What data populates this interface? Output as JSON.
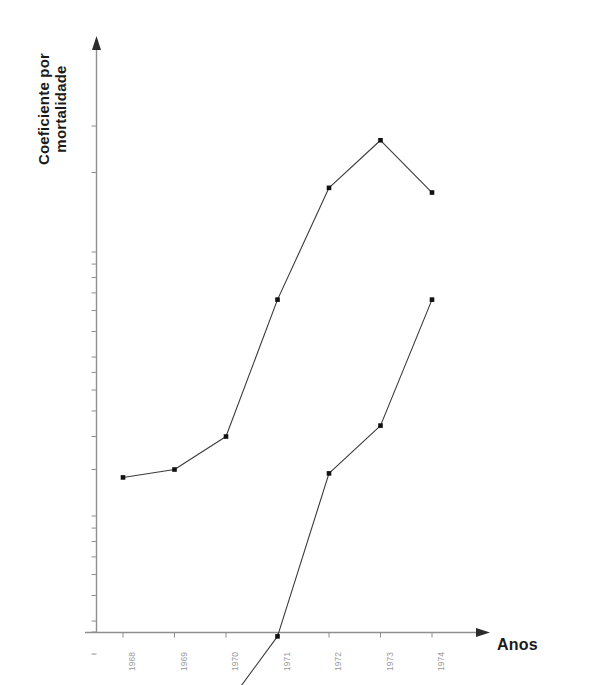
{
  "chart_data": {
    "type": "line",
    "title": "",
    "xlabel": "Anos",
    "ylabel": "Coeficiente por mortalidade",
    "yscale": "log",
    "grid": false,
    "legend": "none",
    "categories": [
      "1968",
      "1969",
      "1970",
      "1971",
      "1972",
      "1973",
      "1974"
    ],
    "x": [
      1968,
      1969,
      1970,
      1971,
      1972,
      1973,
      1974
    ],
    "xlim": [
      1967.6,
      1974.6
    ],
    "ylim": [
      0.1,
      36.0
    ],
    "ytick_labels": [
      "30,0",
      "20,0",
      "10,0",
      "9,0",
      "8,0",
      "7,0",
      "6,0",
      "5,0",
      "4,0",
      "3,5",
      "3,0",
      "2,5",
      "2,0",
      "1,5",
      "1,0",
      "0,9",
      "0,8",
      "0,7",
      "0,6",
      "0,5",
      "0,4",
      "0,3",
      "0,2",
      "0,1",
      "0"
    ],
    "ytick_values": [
      30.0,
      20.0,
      10.0,
      9.0,
      8.0,
      7.0,
      6.0,
      5.0,
      4.0,
      3.5,
      3.0,
      2.5,
      2.0,
      1.5,
      1.0,
      0.9,
      0.8,
      0.7,
      0.6,
      0.5,
      0.4,
      0.3,
      0.2,
      0.1,
      0
    ],
    "xtick_labels": [
      "1968",
      "1969",
      "1970",
      "1971",
      "1972",
      "1973",
      "1974"
    ],
    "series": [
      {
        "name": "serie-superior",
        "color": "#3a3a3a",
        "values": [
          1.4,
          1.5,
          2.0,
          6.6,
          17.5,
          26.5,
          16.8
        ]
      },
      {
        "name": "serie-inferior",
        "color": "#3a3a3a",
        "values": [
          0.12,
          0.11,
          0.19,
          0.35,
          1.45,
          2.2,
          6.6
        ]
      }
    ]
  },
  "axes": {
    "y_title": "Coeficiente por mortalidade",
    "x_title": "Anos"
  },
  "colors": {
    "background": "#ffffff",
    "axis": "#8f8f8f",
    "line": "#3a3a3a",
    "marker": "#111111",
    "tick_text": "#8f8f8f",
    "title_text": "#1a1a1a"
  }
}
